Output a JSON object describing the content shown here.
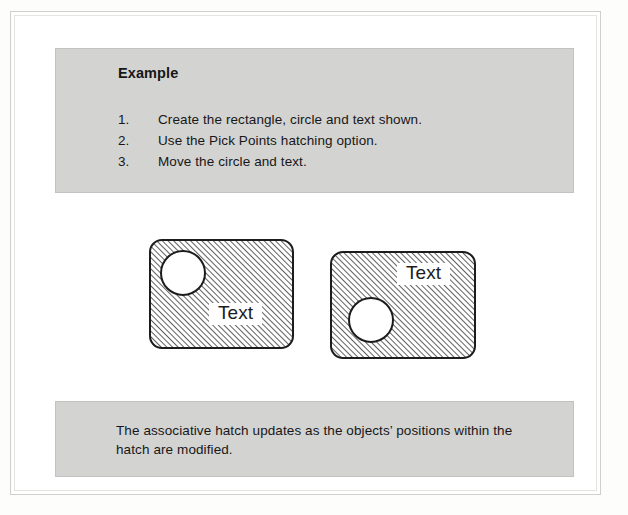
{
  "document": {
    "type": "printed-page-figure",
    "background_color": "#ffffff",
    "callout_background_color": "#d3d3d2",
    "callout_border_color": "#c2c2c0",
    "ink_color": "#1c1c1c"
  },
  "instructions": {
    "heading": "Example",
    "steps": [
      {
        "number": "1.",
        "text": "Create the rectangle, circle and text shown."
      },
      {
        "number": "2.",
        "text": "Use the Pick Points hatching option."
      },
      {
        "number": "3.",
        "text": "Move the circle and text."
      }
    ]
  },
  "caption": {
    "text": "The associative hatch updates as the objects’ positions within the hatch are modified."
  },
  "figures": {
    "hatch": {
      "angle_degrees": 45,
      "spacing_px": 4,
      "line_width_px": 1.4,
      "line_color": "#1c1c1c",
      "fill_color": "#ffffff"
    },
    "before": {
      "label": "before-move",
      "rect": {
        "x": 150,
        "y": 240,
        "width": 143,
        "height": 108,
        "corner_radius": 12
      },
      "circle": {
        "cx": 183,
        "cy": 273,
        "r": 22
      },
      "text": {
        "value": "Text",
        "x": 209,
        "y": 303,
        "width": 53,
        "height": 22
      }
    },
    "after": {
      "label": "after-move",
      "rect": {
        "x": 331,
        "y": 252,
        "width": 144,
        "height": 106,
        "corner_radius": 12
      },
      "circle": {
        "cx": 371,
        "cy": 320,
        "r": 22
      },
      "text": {
        "value": "Text",
        "x": 397,
        "y": 263,
        "width": 53,
        "height": 22
      }
    }
  }
}
